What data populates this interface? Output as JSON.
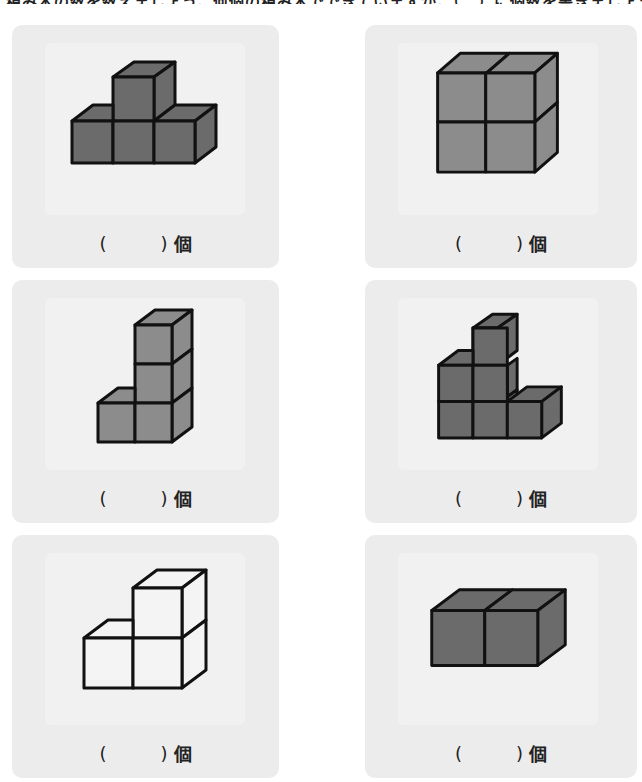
{
  "header": {
    "instruction": "積み木の数を数えましょう。何個の積み木でできていますか。（　）に個数を書きましょう。"
  },
  "colors": {
    "dark_cube": "#6b6b6b",
    "medium_cube": "#8c8c8c",
    "light_cube": "#f4f4f4",
    "stroke": "#111111",
    "card_bg": "#ececec"
  },
  "problems": [
    {
      "id": 1,
      "shape": "pyramid-4-cubes",
      "fill": "dark",
      "open_paren": "(",
      "close_paren": ")",
      "unit": "個"
    },
    {
      "id": 2,
      "shape": "2x2-block",
      "fill": "medium",
      "open_paren": "(",
      "close_paren": ")",
      "unit": "個"
    },
    {
      "id": 3,
      "shape": "L-tower-4-cubes",
      "fill": "medium",
      "open_paren": "(",
      "close_paren": ")",
      "unit": "個"
    },
    {
      "id": 4,
      "shape": "stair-6-cubes",
      "fill": "dark",
      "open_paren": "(",
      "close_paren": ")",
      "unit": "個"
    },
    {
      "id": 5,
      "shape": "L-3-cubes",
      "fill": "light",
      "open_paren": "(",
      "close_paren": ")",
      "unit": "個"
    },
    {
      "id": 6,
      "shape": "row-2-cubes",
      "fill": "dark",
      "open_paren": "(",
      "close_paren": ")",
      "unit": "個"
    }
  ]
}
